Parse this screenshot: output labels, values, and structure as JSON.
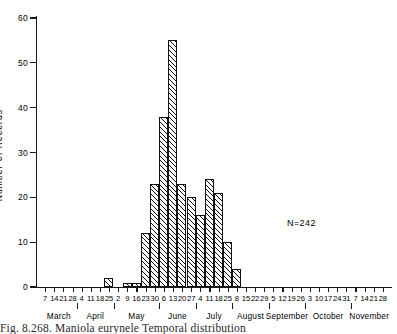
{
  "figure": {
    "caption": "Fig. 8.268.  Maniola eurynele Temporal distribution",
    "annotation": "N=242"
  },
  "chart_data": {
    "type": "bar",
    "title": "",
    "xlabel": "",
    "ylabel": "Number  of  Records",
    "ylim": [
      0,
      60
    ],
    "ytick_values": [
      0,
      10,
      20,
      30,
      40,
      50,
      60
    ],
    "ytick_labels": [
      "0",
      "10",
      "20",
      "30",
      "40",
      "50",
      "60"
    ],
    "grid": false,
    "legend": null,
    "months": [
      {
        "name": "March",
        "days": [
          7,
          14,
          21,
          28
        ]
      },
      {
        "name": "April",
        "days": [
          4,
          11,
          18,
          25
        ]
      },
      {
        "name": "May",
        "days": [
          2,
          9,
          16,
          23,
          30
        ]
      },
      {
        "name": "June",
        "days": [
          6,
          13,
          20,
          27
        ]
      },
      {
        "name": "July",
        "days": [
          4,
          11,
          18,
          25
        ]
      },
      {
        "name": "August",
        "days": [
          8,
          15,
          22,
          29
        ]
      },
      {
        "name": "September",
        "days": [
          5,
          12,
          19,
          26
        ]
      },
      {
        "name": "October",
        "days": [
          3,
          10,
          17,
          24,
          31
        ]
      },
      {
        "name": "November",
        "days": [
          7,
          14,
          21,
          28
        ]
      }
    ],
    "categories": [
      "7",
      "14",
      "21",
      "28",
      "4",
      "11",
      "18",
      "25",
      "2",
      "9",
      "16",
      "23",
      "30",
      "6",
      "13",
      "20",
      "27",
      "4",
      "11",
      "18",
      "25",
      "8",
      "15",
      "22",
      "29",
      "5",
      "12",
      "19",
      "26",
      "3",
      "10",
      "17",
      "24",
      "31",
      "7",
      "14",
      "21",
      "28"
    ],
    "values": [
      0,
      0,
      0,
      0,
      0,
      0,
      0,
      2,
      0,
      1,
      1,
      12,
      23,
      38,
      55,
      23,
      20,
      16,
      24,
      21,
      10,
      4,
      0,
      0,
      0,
      0,
      0,
      0,
      0,
      0,
      0,
      0,
      0,
      0,
      0,
      0,
      0,
      0
    ],
    "total": 242
  }
}
